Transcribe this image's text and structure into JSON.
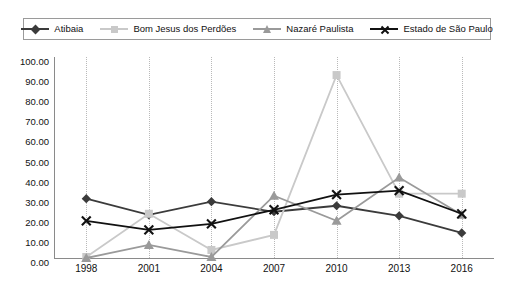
{
  "chart_data": {
    "type": "line",
    "title": "",
    "subtitle": "",
    "xlabel": "",
    "ylabel": "",
    "categories": [
      "1998",
      "2001",
      "2004",
      "2007",
      "2010",
      "2013",
      "2016"
    ],
    "x": [
      1998,
      2001,
      2004,
      2007,
      2010,
      2013,
      2016
    ],
    "ylim": [
      0,
      100
    ],
    "ytick_labels": [
      "0.00",
      "10.00",
      "20.00",
      "30.00",
      "40.00",
      "50.00",
      "60.00",
      "70.00",
      "80.00",
      "90.00",
      "100.00"
    ],
    "ytick_values": [
      0,
      10,
      20,
      30,
      40,
      50,
      60,
      70,
      80,
      90,
      100
    ],
    "grid": "vertical-dotted",
    "legend_position": "top",
    "series": [
      {
        "name": "Atibaia",
        "marker": "diamond",
        "color": "#3b3b3b",
        "values": [
          29.5,
          21.5,
          28.0,
          23.0,
          26.0,
          21.0,
          12.5
        ]
      },
      {
        "name": "Bom Jesus dos Perdões",
        "marker": "square",
        "color": "#c9c9c9",
        "values": [
          0.5,
          22.0,
          4.0,
          11.5,
          91.0,
          32.0,
          32.0
        ]
      },
      {
        "name": "Nazaré Paulista",
        "marker": "triangle",
        "color": "#9a9a9a",
        "values": [
          0.0,
          6.5,
          0.5,
          31.0,
          18.5,
          40.0,
          21.5
        ]
      },
      {
        "name": "Estado de São Paulo",
        "marker": "cross",
        "color": "#111111",
        "values": [
          18.5,
          14.0,
          17.0,
          24.0,
          31.5,
          33.5,
          22.0
        ]
      }
    ]
  },
  "legend": {
    "items": [
      {
        "label": "Atibaia"
      },
      {
        "label": "Bom Jesus dos Perdões"
      },
      {
        "label": "Nazaré Paulista"
      },
      {
        "label": "Estado de São Paulo"
      }
    ]
  }
}
